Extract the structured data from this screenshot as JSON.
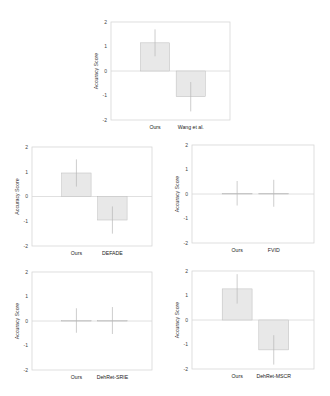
{
  "figure": {
    "bar_fill": "#e8e8e8",
    "bar_stroke": "#bcbcbc",
    "axis_color": "#d6d6d6",
    "zero_line_color": "#d8d8d8",
    "errorbar_color": "#b8b8b8"
  },
  "chart_data": [
    {
      "type": "bar",
      "title": "",
      "xlabel": "",
      "ylabel": "Accuracy Score",
      "ylim": [
        -2,
        2
      ],
      "yticks": [
        2,
        1,
        0,
        -1,
        -2
      ],
      "grid": false,
      "categories": [
        "Ours",
        "Wang et al."
      ],
      "values": [
        1.15,
        -1.05
      ],
      "errors": [
        0.55,
        0.6
      ]
    },
    {
      "type": "bar",
      "title": "",
      "xlabel": "",
      "ylabel": "Accuracy Score",
      "ylim": [
        -2,
        2
      ],
      "yticks": [
        2,
        1,
        0,
        -1,
        -2
      ],
      "grid": false,
      "categories": [
        "Ours",
        "DEFADE"
      ],
      "values": [
        0.95,
        -0.95
      ],
      "errors": [
        0.55,
        0.55
      ]
    },
    {
      "type": "bar",
      "title": "",
      "xlabel": "",
      "ylabel": "Accuracy Score",
      "ylim": [
        -2,
        2
      ],
      "yticks": [
        2,
        1,
        0,
        -1,
        -2
      ],
      "grid": false,
      "categories": [
        "Ours",
        "FVID"
      ],
      "values": [
        0.03,
        0.03
      ],
      "errors": [
        0.5,
        0.55
      ]
    },
    {
      "type": "bar",
      "title": "",
      "xlabel": "",
      "ylabel": "Accuracy Score",
      "ylim": [
        -2,
        2
      ],
      "yticks": [
        2,
        1,
        0,
        -1,
        -2
      ],
      "grid": false,
      "categories": [
        "Ours",
        "DehRet-SRIE"
      ],
      "values": [
        0.02,
        0.02
      ],
      "errors": [
        0.5,
        0.55
      ]
    },
    {
      "type": "bar",
      "title": "",
      "xlabel": "",
      "ylabel": "Accuracy Score",
      "ylim": [
        -2,
        2
      ],
      "yticks": [
        2,
        1,
        0,
        -1,
        -2
      ],
      "grid": false,
      "categories": [
        "Ours",
        "DehRet-MSCR"
      ],
      "values": [
        1.27,
        -1.22
      ],
      "errors": [
        0.6,
        0.6
      ]
    }
  ],
  "layout": [
    {
      "left": 111,
      "top": 22,
      "width": 119,
      "height": 98
    },
    {
      "left": 32,
      "top": 147,
      "width": 120,
      "height": 99
    },
    {
      "left": 192,
      "top": 145,
      "width": 122,
      "height": 98
    },
    {
      "left": 32,
      "top": 272,
      "width": 120,
      "height": 98
    },
    {
      "left": 192,
      "top": 271,
      "width": 122,
      "height": 98
    }
  ]
}
